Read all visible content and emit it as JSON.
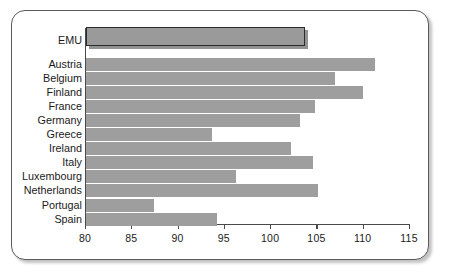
{
  "chart_data": {
    "type": "bar",
    "orientation": "horizontal",
    "title": "",
    "subtitle": "",
    "xlabel": "",
    "ylabel": "",
    "xlim": [
      80,
      115
    ],
    "xticks": [
      80,
      85,
      90,
      95,
      100,
      105,
      110,
      115
    ],
    "xtick_labels": [
      "80",
      "85",
      "90",
      "95",
      "100",
      "105",
      "110",
      "115"
    ],
    "grid": false,
    "legend": null,
    "categories": [
      "EMU",
      "Austria",
      "Belgium",
      "Finland",
      "France",
      "Germany",
      "Greece",
      "Ireland",
      "Italy",
      "Luxembourg",
      "Netherlands",
      "Portugal",
      "Spain"
    ],
    "values": [
      103.8,
      111.3,
      107.0,
      110.0,
      104.8,
      103.2,
      93.7,
      102.3,
      104.6,
      96.3,
      105.2,
      87.5,
      94.3
    ],
    "highlight_category": "EMU",
    "colors": {
      "bar": "#9e9e9e",
      "highlight_bar": "#9a9a9a",
      "highlight_border": "#2b2b2b",
      "axis": "#4a4a4a",
      "text": "#1a1a1a",
      "frame": "#5a5a5a",
      "background": "#ffffff"
    }
  }
}
